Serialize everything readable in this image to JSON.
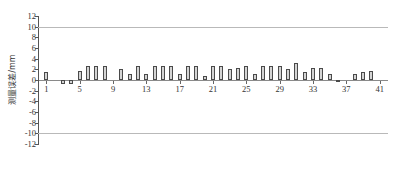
{
  "chart_data": {
    "type": "bar",
    "title": "",
    "xlabel": "",
    "ylabel": "测量误差/mm",
    "ylim": [
      -12,
      12
    ],
    "xlim": [
      0,
      42
    ],
    "yticks": [
      12,
      10,
      8,
      6,
      4,
      2,
      0,
      -2,
      -4,
      -6,
      -8,
      -10,
      -12
    ],
    "ytick_labels": [
      "12",
      "10",
      "8",
      "6",
      "4",
      "2",
      "0",
      "-2",
      "-4",
      "-6",
      "-8",
      "-10",
      "-12"
    ],
    "xticks": [
      1,
      5,
      9,
      13,
      17,
      21,
      25,
      29,
      33,
      37,
      41
    ],
    "xtick_labels": [
      "1",
      "5",
      "9",
      "13",
      "17",
      "21",
      "25",
      "29",
      "33",
      "37",
      "41"
    ],
    "gridlines": [
      10,
      -10
    ],
    "grid": false,
    "legend": null,
    "bar_color": "#d4d4d4",
    "bar_edge_color": "#4a4a4a",
    "gridline_color": "#b9b9b9",
    "axis_color": "#555555",
    "categories": [
      1,
      2,
      3,
      4,
      5,
      6,
      7,
      8,
      9,
      10,
      11,
      12,
      13,
      14,
      15,
      16,
      17,
      18,
      19,
      20,
      21,
      22,
      23,
      24,
      25,
      26,
      27,
      28,
      29,
      30,
      31,
      32,
      33,
      34,
      35,
      36,
      37,
      38,
      39,
      40,
      41
    ],
    "values": [
      1.5,
      0,
      -0.7,
      -0.7,
      1.7,
      2.6,
      2.6,
      2.6,
      0,
      2.0,
      1.2,
      2.6,
      1.2,
      2.6,
      2.6,
      2.6,
      1.2,
      2.6,
      2.6,
      0.8,
      2.6,
      2.6,
      2.0,
      2.2,
      2.6,
      1.2,
      2.6,
      2.6,
      2.6,
      2.0,
      3.2,
      1.5,
      2.2,
      2.2,
      1.2,
      -0.4,
      0,
      1.2,
      1.5,
      1.7,
      0
    ]
  }
}
